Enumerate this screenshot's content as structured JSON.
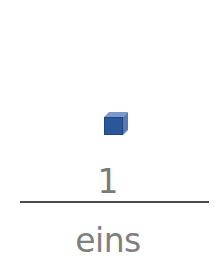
{
  "card": {
    "icon": "blue-cube-icon",
    "cube_count": 1,
    "numeral": "1",
    "word": "eins"
  },
  "colors": {
    "cube_front": "#2a569a",
    "cube_top": "#7c97c9",
    "cube_side": "#5a78b2",
    "text": "#7a7a7a",
    "divider": "#4a4a4a",
    "background": "#ffffff"
  }
}
